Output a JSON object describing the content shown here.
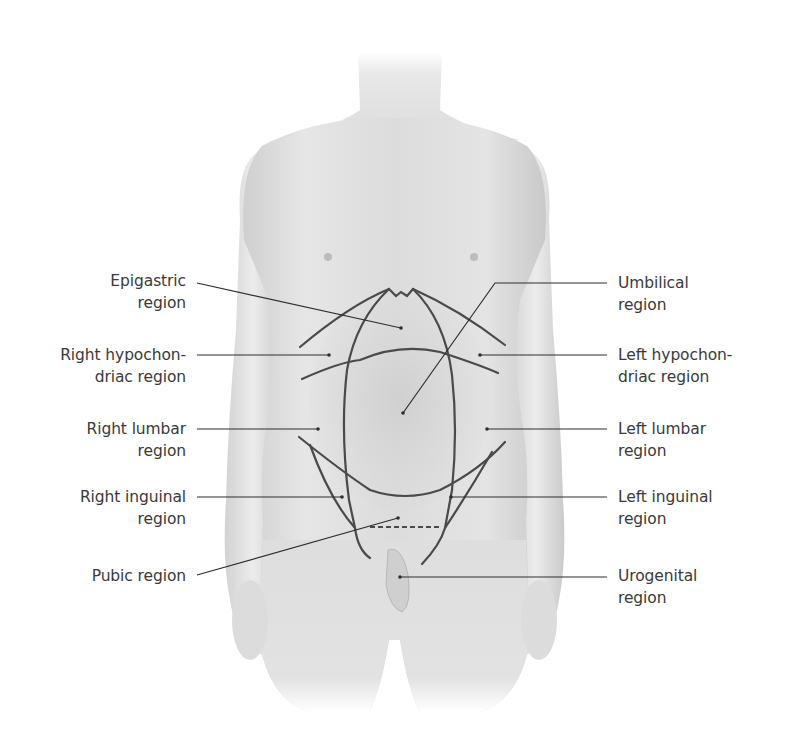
{
  "diagram": {
    "colors": {
      "background": "#ffffff",
      "skin_light": "#ececec",
      "skin_mid": "#d6d6d6",
      "skin_shadow": "#bdbdbd",
      "region_lines": "#4a4a4a",
      "leader_lines": "#2e2e2e",
      "label_text": "#3a3a3a"
    },
    "labels_left": [
      {
        "id": "epigastric",
        "line1": "Epigastric",
        "line2": "region",
        "text_x": 186,
        "text_y": 268,
        "leader": [
          197,
          283,
          401,
          328
        ]
      },
      {
        "id": "right-hypochondriac",
        "line1": "Right hypochon-",
        "line2": "driac region",
        "text_x": 186,
        "text_y": 343,
        "leader": [
          197,
          355,
          329,
          355
        ]
      },
      {
        "id": "right-lumbar",
        "line1": "Right lumbar",
        "line2": "region",
        "text_x": 186,
        "text_y": 416,
        "leader": [
          197,
          429,
          318,
          429
        ]
      },
      {
        "id": "right-inguinal",
        "line1": "Right inguinal",
        "line2": "region",
        "text_x": 186,
        "text_y": 485,
        "leader": [
          197,
          497,
          342,
          497
        ]
      },
      {
        "id": "pubic",
        "line1": "Pubic region",
        "line2": "",
        "text_x": 186,
        "text_y": 565,
        "leader": [
          197,
          575,
          398,
          518
        ]
      }
    ],
    "labels_right": [
      {
        "id": "umbilical",
        "line1": "Umbilical",
        "line2": "region",
        "text_x": 618,
        "text_y": 272,
        "leader": [
          607,
          283,
          495,
          283,
          403,
          413
        ]
      },
      {
        "id": "left-hypochondriac",
        "line1": "Left hypochon-",
        "line2": "driac region",
        "text_x": 618,
        "text_y": 343,
        "leader": [
          607,
          355,
          480,
          355
        ]
      },
      {
        "id": "left-lumbar",
        "line1": "Left lumbar",
        "line2": "region",
        "text_x": 618,
        "text_y": 416,
        "leader": [
          607,
          429,
          487,
          429
        ]
      },
      {
        "id": "left-inguinal",
        "line1": "Left inguinal",
        "line2": "region",
        "text_x": 618,
        "text_y": 485,
        "leader": [
          607,
          497,
          451,
          497
        ]
      },
      {
        "id": "urogenital",
        "line1": "Urogenital",
        "line2": "region",
        "text_x": 618,
        "text_y": 565,
        "leader": [
          607,
          577,
          400,
          577
        ]
      }
    ]
  }
}
